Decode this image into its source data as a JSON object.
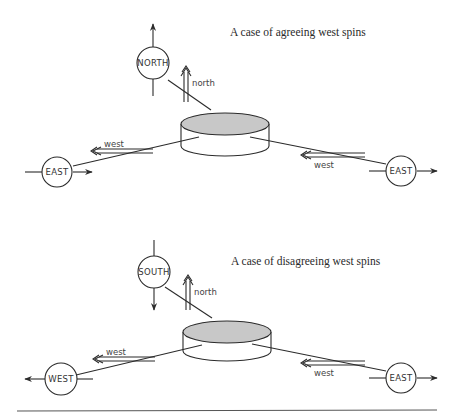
{
  "panels": [
    {
      "caption": "A case of agreeing west spins",
      "detectors": {
        "top": {
          "label": "NORTH",
          "arrow": "up"
        },
        "left": {
          "label": "EAST",
          "arrow": "right"
        },
        "right": {
          "label": "EAST",
          "arrow": "right"
        }
      },
      "spin_labels": {
        "top": "north",
        "left": "west",
        "right": "west"
      }
    },
    {
      "caption": "A case of disagreeing west spins",
      "detectors": {
        "top": {
          "label": "SOUTH",
          "arrow": "down"
        },
        "left": {
          "label": "WEST",
          "arrow": "left"
        },
        "right": {
          "label": "EAST",
          "arrow": "right"
        }
      },
      "spin_labels": {
        "top": "north",
        "left": "west",
        "right": "west"
      }
    }
  ],
  "colors": {
    "disc_top": "#c8c8c8",
    "stroke": "#2b2b2b",
    "background": "#ffffff"
  }
}
